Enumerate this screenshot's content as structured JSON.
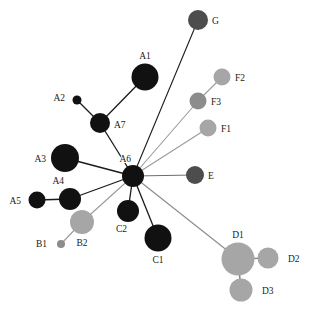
{
  "figure": {
    "type": "haplotype-network",
    "background_color": "#ffffff",
    "width": 314,
    "height": 316
  },
  "palette": {
    "black": "#111111",
    "dark_gray": "#4d4d4d",
    "medium_gray": "#8c8c8c",
    "light_gray": "#a6a6a6",
    "edge_dark": "#1a1a1a",
    "edge_light": "#9a9a9a",
    "label_color": "#1a1a1a"
  },
  "chart_data": {
    "type": "network",
    "title": "",
    "nodes": [
      {
        "id": "G",
        "label": "G",
        "x": 198,
        "y": 20,
        "r": 10,
        "color": "#4d4d4d",
        "label_dx": 14,
        "label_dy": 3.5,
        "group": "G"
      },
      {
        "id": "A1",
        "label": "A1",
        "x": 145,
        "y": 77,
        "r": 13.5,
        "color": "#111111",
        "label_dx": 0,
        "label_dy": -18,
        "group": "A"
      },
      {
        "id": "F2",
        "label": "F2",
        "x": 222,
        "y": 77,
        "r": 8.5,
        "color": "#a6a6a6",
        "label_dx": 13,
        "label_dy": 3.5,
        "group": "F"
      },
      {
        "id": "A2",
        "label": "A2",
        "x": 77,
        "y": 100,
        "r": 4.5,
        "color": "#111111",
        "label_dx": -12,
        "label_dy": 0.5,
        "group": "A"
      },
      {
        "id": "F3",
        "label": "F3",
        "x": 198,
        "y": 101,
        "r": 8.5,
        "color": "#8c8c8c",
        "label_dx": 13,
        "label_dy": 3.5,
        "group": "F"
      },
      {
        "id": "A7",
        "label": "A7",
        "x": 100,
        "y": 123,
        "r": 10,
        "color": "#111111",
        "label_dx": 14,
        "label_dy": 5,
        "group": "A"
      },
      {
        "id": "F1",
        "label": "F1",
        "x": 208,
        "y": 128,
        "r": 8.5,
        "color": "#a6a6a6",
        "label_dx": 13,
        "label_dy": 3.5,
        "group": "F"
      },
      {
        "id": "A3",
        "label": "A3",
        "x": 65,
        "y": 158,
        "r": 14,
        "color": "#111111",
        "label_dx": -19,
        "label_dy": 3.5,
        "group": "A"
      },
      {
        "id": "A6",
        "label": "A6",
        "x": 133,
        "y": 176,
        "r": 11,
        "color": "#111111",
        "label_dx": -2,
        "label_dy": -14,
        "group": "A"
      },
      {
        "id": "E",
        "label": "E",
        "x": 195,
        "y": 175,
        "r": 9,
        "color": "#4d4d4d",
        "label_dx": 13,
        "label_dy": 3.5,
        "group": "E"
      },
      {
        "id": "A4",
        "label": "A4",
        "x": 70,
        "y": 199,
        "r": 11,
        "color": "#111111",
        "label_dx": -6,
        "label_dy": -15,
        "group": "A"
      },
      {
        "id": "A5",
        "label": "A5",
        "x": 37,
        "y": 200,
        "r": 8.5,
        "color": "#111111",
        "label_dx": -16,
        "label_dy": 3.5,
        "group": "A"
      },
      {
        "id": "C2",
        "label": "C2",
        "x": 128,
        "y": 211,
        "r": 11,
        "color": "#111111",
        "label_dx": -1,
        "label_dy": 21,
        "group": "C"
      },
      {
        "id": "B2",
        "label": "B2",
        "x": 82,
        "y": 222,
        "r": 12,
        "color": "#a6a6a6",
        "label_dx": 0,
        "label_dy": 24,
        "group": "B"
      },
      {
        "id": "C1",
        "label": "C1",
        "x": 158,
        "y": 238,
        "r": 13.5,
        "color": "#111111",
        "label_dx": 0,
        "label_dy": 25,
        "group": "C"
      },
      {
        "id": "B1",
        "label": "B1",
        "x": 61,
        "y": 244,
        "r": 4,
        "color": "#8c8c8c",
        "label_dx": -14,
        "label_dy": 2.5,
        "group": "B"
      },
      {
        "id": "D1",
        "label": "D1",
        "x": 238,
        "y": 259,
        "r": 16.5,
        "color": "#a6a6a6",
        "label_dx": 0,
        "label_dy": -21,
        "group": "D"
      },
      {
        "id": "D2",
        "label": "D2",
        "x": 268,
        "y": 258,
        "r": 10.5,
        "color": "#a6a6a6",
        "label_dx": 20,
        "label_dy": 3.5,
        "group": "D"
      },
      {
        "id": "D3",
        "label": "D3",
        "x": 241,
        "y": 290,
        "r": 11.5,
        "color": "#a6a6a6",
        "label_dx": 21,
        "label_dy": 3.5,
        "group": "D"
      }
    ],
    "edges": [
      {
        "source": "A6",
        "target": "G",
        "color": "#1a1a1a",
        "width": 1.1
      },
      {
        "source": "A6",
        "target": "F3",
        "color": "#9a9a9a",
        "width": 1.1
      },
      {
        "source": "A6",
        "target": "F1",
        "color": "#9a9a9a",
        "width": 1.1
      },
      {
        "source": "F3",
        "target": "F2",
        "color": "#9a9a9a",
        "width": 1.1
      },
      {
        "source": "A6",
        "target": "E",
        "color": "#6e6e6e",
        "width": 1.2
      },
      {
        "source": "A6",
        "target": "D1",
        "color": "#8a8a8a",
        "width": 1.1
      },
      {
        "source": "D1",
        "target": "D2",
        "color": "#8a8a8a",
        "width": 1.6
      },
      {
        "source": "D1",
        "target": "D3",
        "color": "#8a8a8a",
        "width": 1.6
      },
      {
        "source": "A6",
        "target": "A3",
        "color": "#1a1a1a",
        "width": 1.3
      },
      {
        "source": "A6",
        "target": "A4",
        "color": "#1a1a1a",
        "width": 1.3
      },
      {
        "source": "A6",
        "target": "A7",
        "color": "#1a1a1a",
        "width": 1.3
      },
      {
        "source": "A7",
        "target": "A1",
        "color": "#1a1a1a",
        "width": 1.3
      },
      {
        "source": "A7",
        "target": "A2",
        "color": "#1a1a1a",
        "width": 1.3
      },
      {
        "source": "A4",
        "target": "A5",
        "color": "#1a1a1a",
        "width": 1.3
      },
      {
        "source": "A6",
        "target": "C2",
        "color": "#1a1a1a",
        "width": 1.3
      },
      {
        "source": "A6",
        "target": "C1",
        "color": "#1a1a1a",
        "width": 1.3
      },
      {
        "source": "A6",
        "target": "B2",
        "color": "#9a9a9a",
        "width": 1.1
      },
      {
        "source": "B2",
        "target": "B1",
        "color": "#9a9a9a",
        "width": 1.1
      }
    ],
    "legend": [],
    "annotations": []
  }
}
